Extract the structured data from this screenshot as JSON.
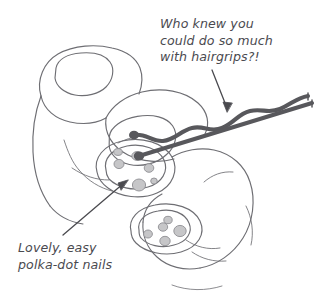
{
  "illustration": {
    "title": "Hand with polka-dot nails and a hairgrip",
    "background_color": "#ffffff",
    "line_color": "#6e6e73",
    "ink_color": "#4a4a4f",
    "hairgrip_color": "#58585c",
    "dot_fill_color": "#c6c6c8",
    "dot_stroke_color": "#8e8e93"
  },
  "annotations": {
    "hairgrip": {
      "name": "hairgrip-caption",
      "lines": [
        "Who knew you",
        "could do so much",
        "with hairgrips?!"
      ],
      "text": "Who knew you\ncould do so much\nwith hairgrips?!",
      "arrow": "down-right"
    },
    "nails": {
      "name": "nails-caption",
      "lines": [
        "Lovely, easy",
        "polka-dot nails"
      ],
      "text": "Lovely, easy\npolka-dot nails",
      "arrow": "up-right"
    }
  },
  "objects": {
    "hand": {
      "label": "hand",
      "nails": [
        {
          "label": "nail-index",
          "decorated": false,
          "dots": 0
        },
        {
          "label": "nail-middle",
          "decorated": false,
          "dots": 0
        },
        {
          "label": "nail-thumb",
          "decorated": true,
          "dots": 6
        },
        {
          "label": "nail-ring",
          "decorated": true,
          "dots": 5
        }
      ]
    },
    "hairgrip": {
      "label": "hairgrip",
      "style": "bobby-pin",
      "arms": [
        "wavy-upper-arm",
        "straight-lower-arm"
      ],
      "tips": 2
    }
  }
}
